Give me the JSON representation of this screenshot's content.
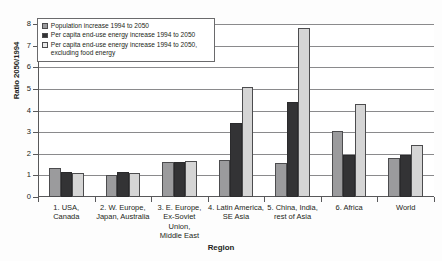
{
  "chart_data": {
    "type": "bar",
    "title": "",
    "xlabel": "Region",
    "ylabel": "Ratio 2050/1994",
    "ylim": [
      0,
      8
    ],
    "yticks": [
      0,
      1,
      2,
      3,
      4,
      5,
      6,
      7,
      8
    ],
    "grid": true,
    "legend_position": "top-left inside",
    "categories": [
      "1. USA,\nCanada",
      "2. W. Europe,\nJapan, Australia",
      "3. E. Europe,\nEx-Soviet\nUnion,\nMiddle East",
      "4. Latin America,\nSE Asia",
      "5. China, India,\nrest of Asia",
      "6. Africa",
      "World"
    ],
    "category_lines": [
      [
        "1. USA,",
        "Canada"
      ],
      [
        "2. W. Europe,",
        "Japan, Australia"
      ],
      [
        "3. E. Europe,",
        "Ex-Soviet",
        "Union,",
        "Middle East"
      ],
      [
        "4. Latin America,",
        "SE Asia"
      ],
      [
        "5. China, India,",
        "rest of Asia"
      ],
      [
        "6. Africa"
      ],
      [
        "World"
      ]
    ],
    "series": [
      {
        "name": "Population increase 1994 to 2050",
        "color": "#9b9b9d",
        "values": [
          1.35,
          1.0,
          1.6,
          1.7,
          1.55,
          3.05,
          1.8
        ]
      },
      {
        "name": "Per capita end-use energy increase 1994 to 2050",
        "color": "#333335",
        "values": [
          1.15,
          1.15,
          1.6,
          3.4,
          4.4,
          1.95,
          1.95
        ]
      },
      {
        "name": "Per capita end-use energy increase 1994 to 2050, excluding food energy",
        "color": "#d5d5d5",
        "values": [
          1.1,
          1.1,
          1.65,
          5.1,
          7.8,
          4.3,
          2.4
        ]
      }
    ]
  },
  "legend": {
    "entries": [
      {
        "label": "Population increase 1994 to 2050"
      },
      {
        "label": "Per capita end-use energy increase 1994 to 2050"
      },
      {
        "label": "Per capita end-use energy increase 1994 to 2050, excluding food energy"
      }
    ]
  },
  "axes": {
    "y_title": "Ratio 2050/1994",
    "x_title": "Region",
    "y_tick_labels": [
      "0",
      "1",
      "2",
      "3",
      "4",
      "5",
      "6",
      "7",
      "8"
    ]
  }
}
